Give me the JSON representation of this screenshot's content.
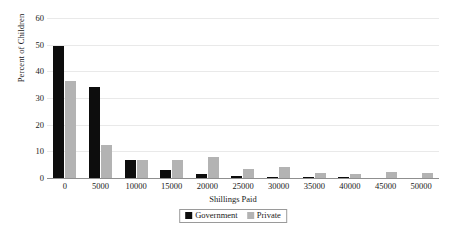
{
  "chart_data": {
    "type": "bar",
    "title": "",
    "subtitle": "",
    "xlabel": "Shillings Paid",
    "ylabel": "Percent of Children",
    "categories": [
      "0",
      "5000",
      "10000",
      "15000",
      "20000",
      "25000",
      "30000",
      "35000",
      "40000",
      "45000",
      "50000"
    ],
    "series": [
      {
        "name": "Government",
        "color": "#0d0d0d",
        "values": [
          49.5,
          34.0,
          6.8,
          3.0,
          1.5,
          0.8,
          0.5,
          0.3,
          0.2,
          0.0,
          0.0
        ]
      },
      {
        "name": "Private",
        "color": "#b3b3b3",
        "values": [
          36.5,
          12.5,
          6.8,
          6.8,
          7.8,
          3.2,
          4.2,
          2.0,
          1.5,
          2.2,
          1.8
        ]
      }
    ],
    "ylim": [
      0,
      60
    ],
    "yticks": [
      0,
      10,
      20,
      30,
      40,
      50,
      60
    ],
    "ytick_labels": [
      "0",
      "10",
      "20",
      "30",
      "40",
      "50",
      "60"
    ],
    "xtick_labels": [
      "0",
      "5000",
      "10000",
      "15000",
      "20000",
      "25000",
      "30000",
      "35000",
      "40000",
      "45000",
      "50000"
    ],
    "grid": true,
    "grid_color": "#e9e9e9",
    "legend_position": "bottom-center",
    "legend_entries": [
      "Government",
      "Private"
    ],
    "axis_color": "#8f8f8f",
    "background": "#ffffff"
  },
  "legend": {
    "government_label": "Government",
    "private_label": "Private"
  },
  "axes": {
    "x_title": "Shillings Paid",
    "y_title": "Percent of Children"
  }
}
